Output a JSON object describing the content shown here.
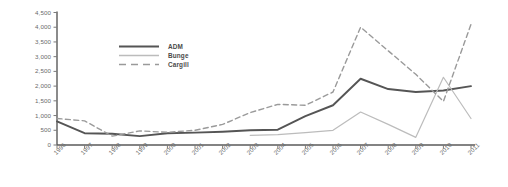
{
  "chart_data": {
    "type": "line",
    "title": "",
    "xlabel": "",
    "ylabel": "",
    "grid": false,
    "legend_position": "upper-left-inside",
    "x": [
      "1996",
      "1997",
      "1998",
      "1999",
      "2000",
      "2001",
      "2002",
      "2003",
      "2004",
      "2005",
      "2006",
      "2007",
      "2008",
      "2009",
      "2010",
      "2011"
    ],
    "ylim": [
      0,
      4500
    ],
    "yticks": [
      "0",
      "500",
      "1,000",
      "1,500",
      "2,000",
      "2,500",
      "3,000",
      "3,500",
      "4,000",
      "4,500"
    ],
    "ytick_values": [
      0,
      500,
      1000,
      1500,
      2000,
      2500,
      3000,
      3500,
      4000,
      4500
    ],
    "series": [
      {
        "name": "ADM",
        "color": "#555555",
        "style": "solid",
        "width": 1.9,
        "values": [
          800,
          400,
          380,
          300,
          400,
          420,
          450,
          500,
          520,
          980,
          1350,
          2250,
          1900,
          1800,
          1850,
          2000
        ]
      },
      {
        "name": "Bunge",
        "color": "#bcbcbc",
        "style": "solid",
        "width": 1.2,
        "values": [
          null,
          null,
          null,
          null,
          null,
          null,
          null,
          330,
          350,
          420,
          500,
          1120,
          700,
          260,
          2300,
          900
        ]
      },
      {
        "name": "Cargill",
        "color": "#9a9a9a",
        "style": "dashed",
        "width": 1.4,
        "values": [
          900,
          820,
          300,
          480,
          430,
          500,
          700,
          1100,
          1380,
          1350,
          1800,
          4000,
          3200,
          2400,
          1480,
          4100
        ]
      }
    ]
  },
  "legend": {
    "items": [
      {
        "label": "ADM"
      },
      {
        "label": "Bunge"
      },
      {
        "label": "Cargill"
      }
    ]
  }
}
